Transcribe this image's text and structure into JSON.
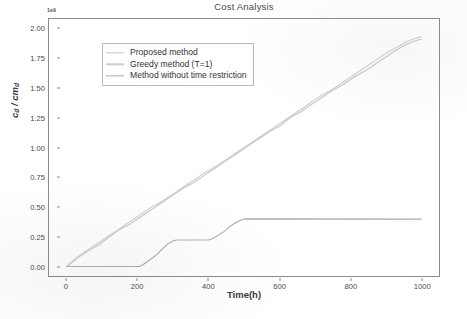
{
  "figure": {
    "background_color": "#ffffff",
    "axes_edge_color": "#8a8a8a"
  },
  "chart_data": {
    "type": "line",
    "title": "Cost Analysis",
    "xlabel": "Time(h)",
    "ylabel": "c_d / cm_d",
    "ylabel_parts": {
      "main1": "c",
      "sub1": "d",
      "sep": " / ",
      "main2": "cm",
      "sub2": "d"
    },
    "y_offset_text": "1e9",
    "y_scale_multiplier": 1000000000,
    "xlim": [
      -50,
      1050
    ],
    "ylim": [
      -0.08,
      2.08
    ],
    "xticks": [
      0,
      200,
      400,
      600,
      800,
      1000
    ],
    "xticklabels": [
      "0",
      "200",
      "400",
      "600",
      "800",
      "1000"
    ],
    "yticks": [
      0.0,
      0.25,
      0.5,
      0.75,
      1.0,
      1.25,
      1.5,
      1.75,
      2.0
    ],
    "yticklabels": [
      "0.00",
      "0.25",
      "0.50",
      "0.75",
      "1.00",
      "1.25",
      "1.50",
      "1.75",
      "2.00"
    ],
    "grid": false,
    "legend_position": "upper left",
    "series": [
      {
        "name": "Proposed method",
        "color": "#c2c4c8",
        "linewidth": 1.1,
        "x": [
          0,
          10,
          30,
          60,
          90,
          120,
          150,
          180,
          210,
          240,
          270,
          300,
          330,
          360,
          390,
          420,
          450,
          480,
          510,
          540,
          570,
          600,
          630,
          660,
          690,
          720,
          750,
          780,
          810,
          840,
          870,
          900,
          930,
          960,
          985,
          1000
        ],
        "y": [
          0.0,
          0.02,
          0.07,
          0.13,
          0.18,
          0.25,
          0.31,
          0.36,
          0.42,
          0.48,
          0.54,
          0.6,
          0.66,
          0.71,
          0.77,
          0.83,
          0.89,
          0.95,
          1.01,
          1.07,
          1.13,
          1.18,
          1.25,
          1.3,
          1.36,
          1.42,
          1.48,
          1.53,
          1.59,
          1.64,
          1.7,
          1.76,
          1.82,
          1.87,
          1.9,
          1.91
        ]
      },
      {
        "name": "Greedy method (T=1)",
        "color": "#cbcdd1",
        "linewidth": 1.1,
        "x": [
          0,
          10,
          30,
          60,
          90,
          120,
          150,
          180,
          210,
          240,
          270,
          300,
          330,
          360,
          390,
          420,
          450,
          480,
          510,
          540,
          570,
          600,
          630,
          660,
          690,
          720,
          750,
          780,
          810,
          840,
          870,
          900,
          930,
          960,
          985,
          1000
        ],
        "y": [
          0.0,
          0.03,
          0.08,
          0.14,
          0.2,
          0.26,
          0.32,
          0.38,
          0.44,
          0.5,
          0.55,
          0.61,
          0.67,
          0.73,
          0.79,
          0.84,
          0.9,
          0.96,
          1.02,
          1.08,
          1.14,
          1.2,
          1.26,
          1.32,
          1.38,
          1.44,
          1.49,
          1.55,
          1.61,
          1.67,
          1.73,
          1.79,
          1.84,
          1.89,
          1.92,
          1.93
        ]
      },
      {
        "name": "Method without time restriction",
        "color": "#a9abaf",
        "linewidth": 1.1,
        "x": [
          0,
          205,
          215,
          250,
          285,
          300,
          310,
          400,
          412,
          445,
          455,
          475,
          495,
          505,
          1000
        ],
        "y": [
          0.0,
          0.0,
          0.015,
          0.09,
          0.19,
          0.215,
          0.222,
          0.222,
          0.235,
          0.295,
          0.325,
          0.365,
          0.395,
          0.4,
          0.398
        ]
      }
    ],
    "legend_entries": [
      {
        "label": "Proposed method",
        "color": "#c2c4c8"
      },
      {
        "label": "Greedy method (T=1)",
        "color": "#cbcdd1"
      },
      {
        "label": "Method without time restriction",
        "color": "#a9abaf"
      }
    ]
  }
}
